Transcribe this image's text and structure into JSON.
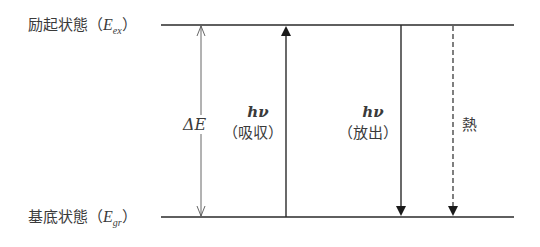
{
  "diagram": {
    "levels": {
      "excited": {
        "name": "励起状態",
        "symbol": "E",
        "subscript": "ex",
        "open": "（",
        "close": "）"
      },
      "ground": {
        "name": "基底状態",
        "symbol": "E",
        "subscript": "gr",
        "open": "（",
        "close": "）"
      }
    },
    "gap": {
      "label": "ΔE"
    },
    "transitions": [
      {
        "id": "absorption",
        "symbol": "hν",
        "text": "（吸収）",
        "direction": "up",
        "style": "solid"
      },
      {
        "id": "emission",
        "symbol": "hν",
        "text": "（放出）",
        "direction": "down",
        "style": "solid"
      },
      {
        "id": "heat",
        "text": "熱",
        "direction": "down",
        "style": "dashed"
      }
    ],
    "colors": {
      "line": "#2a2a2a",
      "text": "#3a3a3a",
      "background": "#ffffff"
    }
  }
}
